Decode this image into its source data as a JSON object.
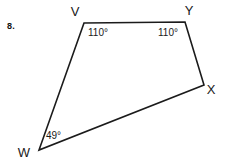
{
  "problem": {
    "number": "8."
  },
  "figure": {
    "shape_name": "quadrilateral",
    "background_color": "#ffffff",
    "line_color": "#1b1b1b",
    "text_color": "#1a1a1a",
    "vertices": [
      {
        "label": "V",
        "x": 84,
        "y": 23,
        "label_x": 75,
        "label_y": 16
      },
      {
        "label": "Y",
        "x": 185,
        "y": 22,
        "label_x": 189,
        "label_y": 15
      },
      {
        "label": "X",
        "x": 204,
        "y": 85,
        "label_x": 211,
        "label_y": 94
      },
      {
        "label": "W",
        "x": 39,
        "y": 150,
        "label_x": 24,
        "label_y": 157
      }
    ],
    "angles": [
      {
        "at_vertex": "V",
        "value": "110°",
        "x": 88,
        "y": 36
      },
      {
        "at_vertex": "Y",
        "value": "110°",
        "x": 158,
        "y": 36
      },
      {
        "at_vertex": "W",
        "value": "49°",
        "x": 46,
        "y": 139
      }
    ],
    "edges": [
      {
        "from": "V",
        "to": "Y"
      },
      {
        "from": "Y",
        "to": "X"
      },
      {
        "from": "X",
        "to": "W"
      },
      {
        "from": "W",
        "to": "V"
      }
    ],
    "path": "M 84 23 L 185 22 L 204 85 L 39 150 Z"
  }
}
